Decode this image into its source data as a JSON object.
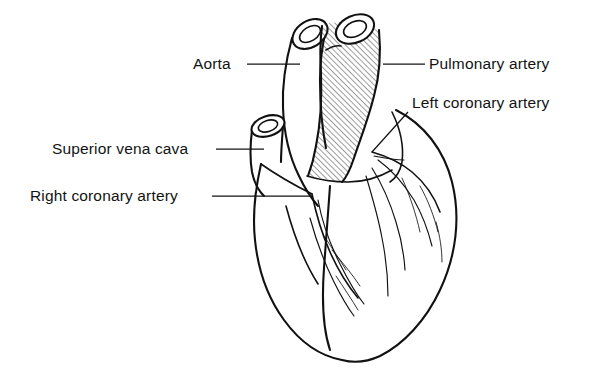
{
  "figure": {
    "background_color": "#ffffff",
    "line_color": "#111111",
    "text_color": "#131313",
    "width": 605,
    "height": 380
  },
  "labels": [
    {
      "id": "aorta",
      "text": "Aorta",
      "x": 193,
      "y": 69,
      "anchor": "start",
      "leader": {
        "type": "line",
        "x1": 247,
        "y1": 64,
        "x2": 300,
        "y2": 64
      }
    },
    {
      "id": "pulmonary-artery",
      "text": "Pulmonary artery",
      "x": 429,
      "y": 69,
      "anchor": "start",
      "leader": {
        "type": "line",
        "x1": 383,
        "y1": 64,
        "x2": 425,
        "y2": 64
      }
    },
    {
      "id": "left-coronary-artery",
      "text": "Left coronary artery",
      "x": 412,
      "y": 108,
      "anchor": "start",
      "leader": {
        "type": "line",
        "x1": 408,
        "y1": 112,
        "x2": 372,
        "y2": 152
      }
    },
    {
      "id": "superior-vena-cava",
      "text": "Superior vena cava",
      "x": 52,
      "y": 154,
      "anchor": "start",
      "leader": {
        "type": "line",
        "x1": 216,
        "y1": 149,
        "x2": 264,
        "y2": 149
      }
    },
    {
      "id": "right-coronary-artery",
      "text": "Right coronary artery",
      "x": 30,
      "y": 201,
      "anchor": "start",
      "leader": {
        "type": "line",
        "x1": 212,
        "y1": 196,
        "x2": 312,
        "y2": 196
      }
    }
  ],
  "structures": [
    {
      "id": "aorta",
      "name": "Aorta",
      "shading": "none"
    },
    {
      "id": "pulmonary-artery",
      "name": "Pulmonary artery",
      "shading": "diagonal-hatch"
    },
    {
      "id": "superior-vena-cava",
      "name": "Superior vena cava",
      "shading": "none"
    },
    {
      "id": "left-coronary-artery",
      "name": "Left coronary artery",
      "shading": "none"
    },
    {
      "id": "right-coronary-artery",
      "name": "Right coronary artery",
      "shading": "none"
    },
    {
      "id": "ventricles",
      "name": "Ventricular mass",
      "shading": "none"
    }
  ]
}
